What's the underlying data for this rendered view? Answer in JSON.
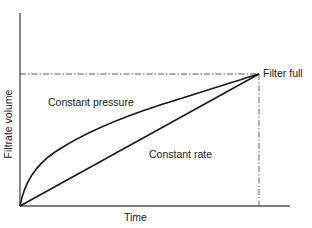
{
  "diagram": {
    "type": "line",
    "xlabel": "Time",
    "ylabel": "Filtrate volume",
    "annotation": "Filter full",
    "series": [
      {
        "name": "Constant pressure",
        "shape": "concave (parabolic, V ~ sqrt(t))"
      },
      {
        "name": "Constant rate",
        "shape": "linear"
      }
    ],
    "end_point": "Filter full (both curves meet)",
    "grid": false,
    "colors": {
      "line": "#1a1a1a",
      "background": "#ffffff"
    }
  }
}
